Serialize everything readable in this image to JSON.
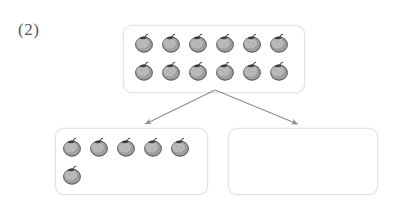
{
  "worksheet": {
    "problem_label": "(2)",
    "item_icon_name": "persimmon-fruit-icon",
    "item_color": "#8f8f8f",
    "box_border_color": "#e4e4e6",
    "arrow_color": "#8c8c8c",
    "background_color": "#ffffff"
  },
  "total_box": {
    "label": "total-group",
    "count": 12,
    "rows": [
      {
        "count": 6
      },
      {
        "count": 6
      }
    ]
  },
  "part_boxes": [
    {
      "label": "part-group-left",
      "count": 6,
      "rows": [
        {
          "count": 5
        },
        {
          "count": 1
        }
      ]
    },
    {
      "label": "part-group-right",
      "count": 0,
      "rows": []
    }
  ],
  "arrows": [
    {
      "name": "arrow-to-left-part",
      "from_x": 215,
      "from_y": 90,
      "to_x": 143,
      "to_y": 125
    },
    {
      "name": "arrow-to-right-part",
      "from_x": 215,
      "from_y": 90,
      "to_x": 300,
      "to_y": 125
    }
  ]
}
